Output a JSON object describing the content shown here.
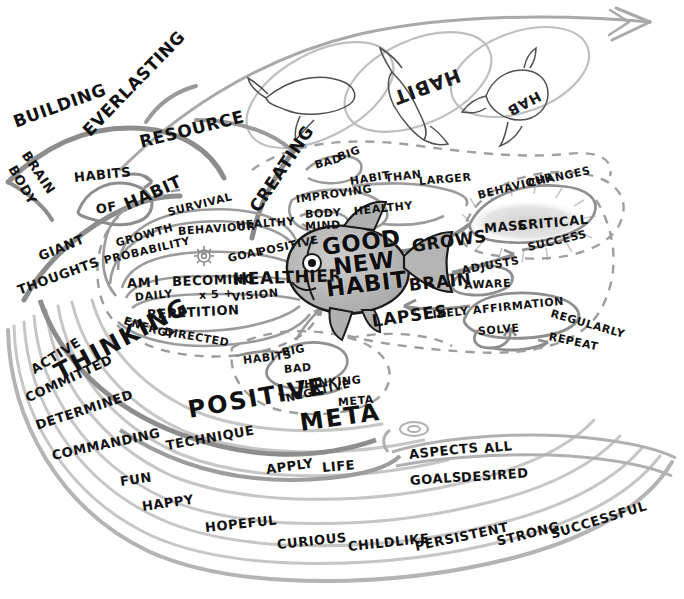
{
  "palette": {
    "ink": "#111111",
    "stroke_dark": "#6d6d6d",
    "stroke_mid": "#9a9a9a",
    "stroke_light": "#c2c2c2",
    "fish_fill": "#b9b9b9",
    "fish_fill_light": "#d2d2d2",
    "highlight_glow": "#d8d8d8",
    "paper": "#ffffff"
  },
  "center": {
    "node_label": "GOOD NEW HABIT",
    "lines": [
      "GOOD",
      "NEW",
      "HABIT"
    ],
    "shape": "fish"
  },
  "ghost_fish": [
    {
      "label": "",
      "note": "leaping fish outline, no text"
    },
    {
      "label": "HABIT",
      "note": "rotated fish label"
    },
    {
      "label": "HAB",
      "note": "rotated fish label"
    }
  ],
  "branches": [
    {
      "id": "building",
      "root": "BUILDING",
      "items": [
        "BUILDING",
        "BRAIN",
        "BODY",
        "HABITS",
        "OF",
        "HABIT",
        "GIANT",
        "THOUGHTS"
      ]
    },
    {
      "id": "everlasting",
      "root": "EVERLASTING",
      "items": [
        "EVERLASTING",
        "RESOURCE"
      ]
    },
    {
      "id": "becoming",
      "root": "AM I BECOMING HEALTHIER",
      "items": [
        "GROWTH",
        "PROBABILITY",
        "SURVIVAL",
        "BEHAVIOUR",
        "HEALTHY",
        "AM",
        "I",
        "BECOMING",
        "HEALTHIER",
        "GOAL",
        "POSITIVE",
        "DAILY",
        "x 5 +",
        "VISION",
        "REPETITION",
        "ENERGY",
        "DIRECTED"
      ]
    },
    {
      "id": "creating",
      "root": "CREATING",
      "items": [
        "CREATING",
        "IMPROVING",
        "BODY",
        "MIND",
        "HEALTHY",
        "BAD",
        "BIG",
        "HABIT",
        "THAN",
        "LARGER"
      ]
    },
    {
      "id": "critical-mass",
      "root": "MASS CRITICAL",
      "items": [
        "BEHAVIOUR",
        "CHANGES",
        "MASS",
        "CRITICAL",
        "SUCCESS",
        "GROWS"
      ]
    },
    {
      "id": "brain-adjusts",
      "root": "BRAIN",
      "items": [
        "BRAIN",
        "ADJUSTS",
        "AWARE",
        "LAPSES",
        "LIKELY",
        "AFFIRMATION",
        "SOLVE",
        "REGULARLY",
        "REPEAT"
      ]
    },
    {
      "id": "meta-bad",
      "root": "META",
      "items": [
        "HABITS",
        "BIG",
        "BAD",
        "THINKING",
        "NEGATIVE",
        "META"
      ]
    },
    {
      "id": "thinking-positive",
      "root": "THINKING POSITIVE META",
      "items": [
        "THINKING",
        "POSITIVE",
        "META",
        "TECHNIQUE",
        "APPLY",
        "LIFE"
      ]
    },
    {
      "id": "attitudes",
      "root": "ACTIVE",
      "items": [
        "ACTIVE",
        "COMMITTED",
        "DETERMINED",
        "COMMANDING",
        "FUN",
        "HAPPY",
        "HOPEFUL",
        "CURIOUS",
        "CHILDLIKE",
        "PERSISTENT",
        "STRONG",
        "SUCCESSFUL"
      ]
    },
    {
      "id": "aspects",
      "root": "ASPECTS ALL",
      "items": [
        "ASPECTS",
        "ALL",
        "GOALS",
        "DESIRED"
      ]
    }
  ],
  "labels": [
    {
      "text": "BUILDING",
      "x": 14,
      "y": 114,
      "rot": -20,
      "size": "big"
    },
    {
      "text": "BRAIN",
      "x": 25,
      "y": 146,
      "rot": 56,
      "size": "med"
    },
    {
      "text": "BODY",
      "x": 12,
      "y": 160,
      "rot": 60,
      "size": "med"
    },
    {
      "text": "EVERLASTING",
      "x": 86,
      "y": 125,
      "rot": -46,
      "size": "big"
    },
    {
      "text": "RESOURCE",
      "x": 140,
      "y": 134,
      "rot": -14,
      "size": "big"
    },
    {
      "text": "HABITS",
      "x": 74,
      "y": 171,
      "rot": -6,
      "size": "med"
    },
    {
      "text": "OF",
      "x": 96,
      "y": 203,
      "rot": -10,
      "size": "med"
    },
    {
      "text": "HABIT",
      "x": 125,
      "y": 197,
      "rot": -24,
      "size": "big"
    },
    {
      "text": "GIANT",
      "x": 39,
      "y": 250,
      "rot": -22,
      "size": "med"
    },
    {
      "text": "THOUGHTS",
      "x": 18,
      "y": 284,
      "rot": -20,
      "size": "med"
    },
    {
      "text": "GROWTH",
      "x": 116,
      "y": 238,
      "rot": -16,
      "size": "sm"
    },
    {
      "text": "PROBABILITY",
      "x": 104,
      "y": 255,
      "rot": -13,
      "size": "sm"
    },
    {
      "text": "SURVIVAL",
      "x": 168,
      "y": 207,
      "rot": -14,
      "size": "sm"
    },
    {
      "text": "BEHAVIOUR",
      "x": 178,
      "y": 226,
      "rot": -4,
      "size": "sm"
    },
    {
      "text": "HEALTHY",
      "x": 236,
      "y": 220,
      "rot": -4,
      "size": "sm"
    },
    {
      "text": "AM",
      "x": 127,
      "y": 277,
      "rot": -3,
      "size": "med"
    },
    {
      "text": "I",
      "x": 154,
      "y": 274,
      "rot": -3,
      "size": "med"
    },
    {
      "text": "BECOMING",
      "x": 172,
      "y": 275,
      "rot": -2,
      "size": "med"
    },
    {
      "text": "HEALTHIER",
      "x": 233,
      "y": 271,
      "rot": -2,
      "size": "big"
    },
    {
      "text": "GOAL",
      "x": 228,
      "y": 253,
      "rot": -12,
      "size": "sm"
    },
    {
      "text": "POSITIVE",
      "x": 258,
      "y": 247,
      "rot": -12,
      "size": "sm"
    },
    {
      "text": "DAILY",
      "x": 135,
      "y": 292,
      "rot": -6,
      "size": "sm"
    },
    {
      "text": "x 5 +",
      "x": 199,
      "y": 290,
      "rot": -4,
      "size": "sm"
    },
    {
      "text": "VISION",
      "x": 232,
      "y": 292,
      "rot": -6,
      "size": "sm"
    },
    {
      "text": "REPETITION",
      "x": 147,
      "y": 308,
      "rot": -3,
      "size": "med"
    },
    {
      "text": "ENERGY",
      "x": 124,
      "y": 315,
      "rot": 17,
      "size": "sm"
    },
    {
      "text": "DIRECTED",
      "x": 164,
      "y": 326,
      "rot": 10,
      "size": "sm"
    },
    {
      "text": "CREATING",
      "x": 254,
      "y": 202,
      "rot": -56,
      "size": "big"
    },
    {
      "text": "IMPROVING",
      "x": 296,
      "y": 194,
      "rot": -8,
      "size": "sm"
    },
    {
      "text": "BODY",
      "x": 305,
      "y": 209,
      "rot": -3,
      "size": "sm"
    },
    {
      "text": "MIND",
      "x": 305,
      "y": 221,
      "rot": -3,
      "size": "sm"
    },
    {
      "text": "HEALTHY",
      "x": 354,
      "y": 206,
      "rot": -6,
      "size": "sm"
    },
    {
      "text": "BAD",
      "x": 315,
      "y": 160,
      "rot": -16,
      "size": "sm"
    },
    {
      "text": "BIG",
      "x": 338,
      "y": 152,
      "rot": -20,
      "size": "sm"
    },
    {
      "text": "HABIT",
      "x": 350,
      "y": 176,
      "rot": -9,
      "size": "sm"
    },
    {
      "text": "THAN",
      "x": 385,
      "y": 173,
      "rot": -7,
      "size": "sm"
    },
    {
      "text": "LARGER",
      "x": 419,
      "y": 176,
      "rot": -5,
      "size": "sm"
    },
    {
      "text": "BEHAVIOUR",
      "x": 478,
      "y": 190,
      "rot": -14,
      "size": "sm"
    },
    {
      "text": "CHANGES",
      "x": 528,
      "y": 178,
      "rot": -12,
      "size": "sm"
    },
    {
      "text": "MASS",
      "x": 484,
      "y": 222,
      "rot": -5,
      "size": "med"
    },
    {
      "text": "CRITICAL",
      "x": 518,
      "y": 219,
      "rot": -5,
      "size": "med"
    },
    {
      "text": "GROWS",
      "x": 412,
      "y": 238,
      "rot": -8,
      "size": "big"
    },
    {
      "text": "SUCCESS",
      "x": 528,
      "y": 242,
      "rot": -13,
      "size": "sm"
    },
    {
      "text": "ADJUSTS",
      "x": 462,
      "y": 265,
      "rot": -10,
      "size": "sm"
    },
    {
      "text": "AWARE",
      "x": 464,
      "y": 280,
      "rot": -3,
      "size": "sm"
    },
    {
      "text": "BRAIN",
      "x": 409,
      "y": 277,
      "rot": -6,
      "size": "big"
    },
    {
      "text": "LAPSES",
      "x": 372,
      "y": 313,
      "rot": -8,
      "size": "big"
    },
    {
      "text": "LIKELY",
      "x": 425,
      "y": 310,
      "rot": -6,
      "size": "sm"
    },
    {
      "text": "AFFIRMATION",
      "x": 473,
      "y": 305,
      "rot": -6,
      "size": "sm"
    },
    {
      "text": "SOLVE",
      "x": 478,
      "y": 326,
      "rot": -5,
      "size": "sm"
    },
    {
      "text": "REGULARLY",
      "x": 551,
      "y": 308,
      "rot": 16,
      "size": "sm"
    },
    {
      "text": "REPEAT",
      "x": 549,
      "y": 331,
      "rot": 12,
      "size": "sm"
    },
    {
      "text": "HABITS",
      "x": 243,
      "y": 355,
      "rot": -7,
      "size": "sm"
    },
    {
      "text": "BIG",
      "x": 282,
      "y": 347,
      "rot": -10,
      "size": "sm"
    },
    {
      "text": "BAD",
      "x": 284,
      "y": 364,
      "rot": -5,
      "size": "sm"
    },
    {
      "text": "THINKING",
      "x": 296,
      "y": 380,
      "rot": -5,
      "size": "sm"
    },
    {
      "text": "NEGATIVE",
      "x": 286,
      "y": 393,
      "rot": -13,
      "size": "sm"
    },
    {
      "text": "META",
      "x": 338,
      "y": 397,
      "rot": -5,
      "size": "sm"
    },
    {
      "text": "THINKING",
      "x": 56,
      "y": 362,
      "rot": -28,
      "size": "huge"
    },
    {
      "text": "POSITIVE",
      "x": 188,
      "y": 398,
      "rot": -10,
      "size": "huge"
    },
    {
      "text": "META",
      "x": 300,
      "y": 411,
      "rot": -8,
      "size": "huge"
    },
    {
      "text": "ACTIVE",
      "x": 32,
      "y": 364,
      "rot": -32,
      "size": "med"
    },
    {
      "text": "COMMITTED",
      "x": 26,
      "y": 392,
      "rot": -25,
      "size": "med"
    },
    {
      "text": "DETERMINED",
      "x": 36,
      "y": 419,
      "rot": -18,
      "size": "med"
    },
    {
      "text": "COMMANDING",
      "x": 52,
      "y": 449,
      "rot": -12,
      "size": "med"
    },
    {
      "text": "FUN",
      "x": 120,
      "y": 475,
      "rot": -8,
      "size": "med"
    },
    {
      "text": "HAPPY",
      "x": 142,
      "y": 500,
      "rot": -8,
      "size": "med"
    },
    {
      "text": "HOPEFUL",
      "x": 205,
      "y": 521,
      "rot": -6,
      "size": "med"
    },
    {
      "text": "CURIOUS",
      "x": 277,
      "y": 538,
      "rot": -6,
      "size": "med"
    },
    {
      "text": "CHILDLIKE",
      "x": 348,
      "y": 540,
      "rot": -6,
      "size": "med"
    },
    {
      "text": "PERSISTENT",
      "x": 415,
      "y": 540,
      "rot": -12,
      "size": "med"
    },
    {
      "text": "STRONG",
      "x": 497,
      "y": 535,
      "rot": -14,
      "size": "med"
    },
    {
      "text": "SUCCESSFUL",
      "x": 551,
      "y": 528,
      "rot": -17,
      "size": "med"
    },
    {
      "text": "TECHNIQUE",
      "x": 166,
      "y": 439,
      "rot": -10,
      "size": "med"
    },
    {
      "text": "APPLY",
      "x": 266,
      "y": 463,
      "rot": -8,
      "size": "med"
    },
    {
      "text": "LIFE",
      "x": 322,
      "y": 461,
      "rot": -5,
      "size": "med"
    },
    {
      "text": "ASPECTS",
      "x": 409,
      "y": 448,
      "rot": -6,
      "size": "med"
    },
    {
      "text": "ALL",
      "x": 484,
      "y": 442,
      "rot": -6,
      "size": "med"
    },
    {
      "text": "GOALS",
      "x": 410,
      "y": 474,
      "rot": -4,
      "size": "med"
    },
    {
      "text": "DESIRED",
      "x": 461,
      "y": 471,
      "rot": -4,
      "size": "med"
    }
  ]
}
